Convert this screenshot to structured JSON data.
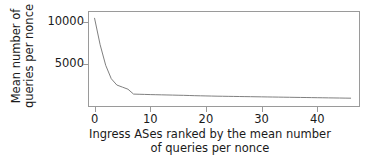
{
  "chart_data": {
    "type": "line",
    "title": "",
    "xlabel": "Ingress ASes ranked by the mean number of queries per nonce",
    "xlabel_line1": "Ingress ASes ranked by the mean number",
    "xlabel_line2": "of queries per nonce",
    "ylabel": "Mean number of queries per nonce",
    "ylabel_line1": "Mean number of",
    "ylabel_line2": "queries per nonce",
    "xticks": [
      0,
      10,
      20,
      30,
      40
    ],
    "xtick_labels": [
      "0",
      "10",
      "20",
      "30",
      "40"
    ],
    "yticks": [
      5000,
      10000
    ],
    "ytick_labels": [
      "5000",
      "10000"
    ],
    "xlim": [
      -1.0,
      47.5
    ],
    "ylim": [
      0,
      11200
    ],
    "grid": false,
    "legend": false,
    "line_color": "#808080",
    "frame_color": "#9a9a9a",
    "background_color": "#ffffff",
    "series": [
      {
        "name": "mean queries per nonce",
        "x": [
          0,
          1,
          2,
          3,
          4,
          5,
          6,
          7,
          8,
          9,
          10,
          11,
          12,
          13,
          14,
          15,
          16,
          17,
          18,
          19,
          20,
          21,
          22,
          23,
          24,
          25,
          26,
          27,
          28,
          29,
          30,
          31,
          32,
          33,
          34,
          35,
          36,
          37,
          38,
          39,
          40,
          41,
          42,
          43,
          44,
          45,
          46
        ],
        "values": [
          10450,
          7300,
          4850,
          3250,
          2500,
          2250,
          2000,
          1420,
          1400,
          1380,
          1360,
          1345,
          1330,
          1315,
          1300,
          1285,
          1270,
          1250,
          1230,
          1215,
          1200,
          1185,
          1170,
          1160,
          1150,
          1140,
          1130,
          1120,
          1110,
          1100,
          1090,
          1080,
          1070,
          1060,
          1050,
          1040,
          1030,
          1020,
          1010,
          1000,
          990,
          980,
          970,
          960,
          950,
          940,
          930
        ]
      }
    ]
  }
}
